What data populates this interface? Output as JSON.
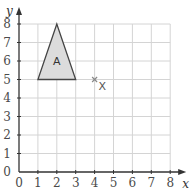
{
  "chart_data": {
    "type": "scatter",
    "title": "",
    "xlabel": "x",
    "ylabel": "y",
    "xlim": [
      0,
      8
    ],
    "ylim": [
      0,
      8
    ],
    "grid": true,
    "x_ticks": [
      "0",
      "1",
      "2",
      "3",
      "4",
      "5",
      "6",
      "7",
      "8"
    ],
    "y_ticks": [
      "0",
      "1",
      "2",
      "3",
      "4",
      "5",
      "6",
      "7",
      "8"
    ],
    "shapes": [
      {
        "name": "A",
        "type": "triangle",
        "vertices": [
          [
            1,
            5
          ],
          [
            3,
            5
          ],
          [
            2,
            8
          ]
        ],
        "fill": "#dcdcdc",
        "stroke": "#444444",
        "label_position": [
          2,
          6
        ]
      }
    ],
    "points": [
      {
        "label": "X",
        "x": 4,
        "y": 5,
        "marker": "x"
      }
    ]
  },
  "labels": {
    "x_axis": "x",
    "y_axis": "y",
    "shape_a": "A",
    "point_x": "X"
  }
}
